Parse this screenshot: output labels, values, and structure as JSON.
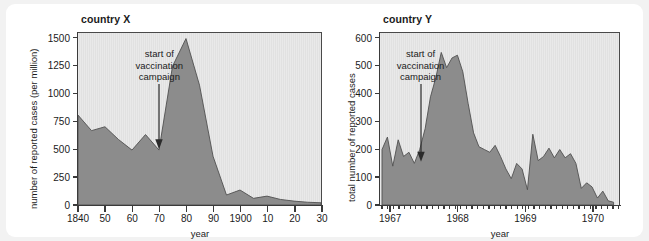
{
  "figures": [
    {
      "id": "country-x",
      "title": "country X",
      "ylabel": "number of reported cases (per million)",
      "xlabel": "year",
      "annotation": "start of\nvaccination\ncampaign",
      "chart_data": {
        "type": "area",
        "title": "country X",
        "xlabel": "year",
        "ylabel": "number of reported cases (per million)",
        "xlim": [
          1840,
          1930
        ],
        "ylim": [
          0,
          1550
        ],
        "yticks": [
          0,
          250,
          500,
          750,
          1000,
          1250,
          1500
        ],
        "ytick_labels": [
          "0",
          "250",
          "500",
          "750",
          "1000",
          "1250",
          "1500"
        ],
        "xticks": [
          1840,
          1850,
          1860,
          1870,
          1880,
          1890,
          1900,
          1910,
          1920,
          1930
        ],
        "xtick_labels": [
          "1840",
          "50",
          "60",
          "70",
          "80",
          "90",
          "1900",
          "10",
          "20",
          "30"
        ],
        "grid": false,
        "legend": null,
        "annotations": [
          {
            "text": "start of vaccination campaign",
            "x": 1870,
            "y": 500,
            "arrow": true
          }
        ],
        "x": [
          1840,
          1845,
          1850,
          1855,
          1860,
          1865,
          1870,
          1875,
          1880,
          1885,
          1890,
          1895,
          1900,
          1905,
          1910,
          1915,
          1920,
          1925,
          1930
        ],
        "values": [
          810,
          670,
          705,
          590,
          495,
          635,
          495,
          1250,
          1500,
          1080,
          440,
          90,
          135,
          60,
          80,
          50,
          35,
          25,
          20
        ]
      }
    },
    {
      "id": "country-y",
      "title": "country Y",
      "ylabel": "total number of reported cases",
      "xlabel": "year",
      "annotation": "start of\nvaccination\ncampaign",
      "chart_data": {
        "type": "area",
        "title": "country Y",
        "xlabel": "year",
        "ylabel": "total number of reported cases",
        "xlim": [
          1966.85,
          1970.4
        ],
        "ylim": [
          0,
          620
        ],
        "yticks": [
          0,
          100,
          200,
          300,
          400,
          500,
          600
        ],
        "ytick_labels": [
          "0",
          "100",
          "200",
          "300",
          "400",
          "500",
          "600"
        ],
        "xticks": [
          1967,
          1968,
          1969,
          1970
        ],
        "xtick_labels": [
          "1967",
          "1968",
          "1969",
          "1970"
        ],
        "minor_tick_interval_years": 0.0833,
        "grid": false,
        "legend": null,
        "annotations": [
          {
            "text": "start of vaccination campaign",
            "x": 1967.45,
            "y": 155,
            "arrow": true
          }
        ],
        "x": [
          1966.88,
          1966.96,
          1967.04,
          1967.12,
          1967.2,
          1967.28,
          1967.36,
          1967.44,
          1967.52,
          1967.6,
          1967.68,
          1967.76,
          1967.84,
          1967.92,
          1968.0,
          1968.08,
          1968.16,
          1968.24,
          1968.32,
          1968.4,
          1968.48,
          1968.56,
          1968.64,
          1968.72,
          1968.8,
          1968.88,
          1968.96,
          1969.04,
          1969.12,
          1969.2,
          1969.28,
          1969.36,
          1969.44,
          1969.52,
          1969.6,
          1969.68,
          1969.76,
          1969.84,
          1969.92,
          1970.0,
          1970.08,
          1970.16,
          1970.24,
          1970.32
        ],
        "values": [
          200,
          245,
          140,
          235,
          175,
          190,
          150,
          200,
          275,
          390,
          460,
          550,
          495,
          530,
          540,
          480,
          365,
          260,
          210,
          200,
          190,
          215,
          175,
          130,
          95,
          150,
          130,
          55,
          255,
          160,
          175,
          205,
          170,
          200,
          170,
          185,
          150,
          60,
          80,
          65,
          25,
          50,
          15,
          10
        ]
      }
    }
  ]
}
